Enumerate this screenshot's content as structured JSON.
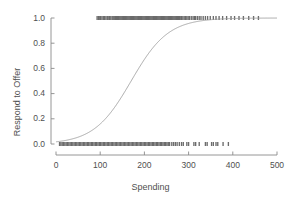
{
  "chart_data": {
    "type": "scatter",
    "title": "",
    "xlabel": "Spending",
    "ylabel": "Respond to Offer",
    "xlim": [
      0,
      500
    ],
    "ylim": [
      0.0,
      1.0
    ],
    "grid": false,
    "legend": null,
    "xticks": [
      0,
      100,
      200,
      300,
      400,
      500
    ],
    "xtick_labels": [
      "0",
      "100",
      "200",
      "300",
      "400",
      "500"
    ],
    "yticks": [
      0.0,
      0.2,
      0.4,
      0.6,
      0.8,
      1.0
    ],
    "ytick_labels": [
      "0.0",
      "0.2",
      "0.4",
      "0.6",
      "0.8",
      "1.0"
    ],
    "axis_color": "#8a8a8a",
    "curve_color": "#9a9a9a",
    "point_color": "#6b6b6b",
    "background_color": "#ffffff",
    "series": [
      {
        "name": "Fitted logistic curve",
        "type": "line",
        "midpoint_x": 170,
        "slope_scale": 42,
        "color": "#9a9a9a"
      },
      {
        "name": "Responders (y = 1)",
        "type": "rug",
        "y": 1.0,
        "color": "#6b6b6b",
        "x": [
          93,
          96,
          99,
          101,
          104,
          107,
          110,
          113,
          116,
          118,
          121,
          124,
          127,
          129,
          131,
          133,
          135,
          137,
          139,
          141,
          143,
          145,
          147,
          149,
          151,
          153,
          155,
          157,
          159,
          161,
          163,
          165,
          167,
          169,
          171,
          173,
          175,
          177,
          179,
          181,
          183,
          185,
          187,
          189,
          191,
          193,
          195,
          197,
          199,
          201,
          203,
          205,
          207,
          209,
          211,
          213,
          215,
          217,
          219,
          221,
          223,
          225,
          227,
          229,
          231,
          233,
          235,
          237,
          239,
          241,
          243,
          245,
          247,
          249,
          251,
          253,
          255,
          257,
          259,
          261,
          263,
          265,
          267,
          269,
          271,
          273,
          275,
          277,
          279,
          281,
          284,
          287,
          290,
          293,
          296,
          299,
          302,
          306,
          310,
          313,
          316,
          320,
          324,
          328,
          333,
          338,
          343,
          349,
          356,
          362,
          369,
          377,
          386,
          396,
          404,
          414,
          424,
          436,
          447,
          458
        ]
      },
      {
        "name": "Non-responders (y = 0)",
        "type": "rug",
        "y": 0.0,
        "color": "#6b6b6b",
        "x": [
          8,
          11,
          14,
          17,
          20,
          23,
          26,
          29,
          32,
          35,
          38,
          41,
          44,
          47,
          50,
          53,
          56,
          59,
          62,
          65,
          68,
          71,
          74,
          77,
          80,
          83,
          86,
          89,
          92,
          95,
          98,
          101,
          104,
          107,
          110,
          113,
          116,
          119,
          122,
          125,
          128,
          131,
          134,
          137,
          140,
          143,
          146,
          149,
          152,
          155,
          158,
          161,
          164,
          167,
          170,
          173,
          176,
          179,
          182,
          185,
          188,
          191,
          194,
          197,
          200,
          203,
          206,
          209,
          212,
          215,
          218,
          221,
          224,
          227,
          230,
          233,
          236,
          239,
          242,
          245,
          248,
          251,
          254,
          257,
          262,
          266,
          270,
          274,
          279,
          284,
          288,
          296,
          300,
          312,
          316,
          324,
          338,
          342,
          352,
          356,
          362,
          366,
          378,
          390
        ]
      }
    ]
  },
  "labels": {
    "x_title": "Spending",
    "y_title": "Respond to Offer"
  }
}
